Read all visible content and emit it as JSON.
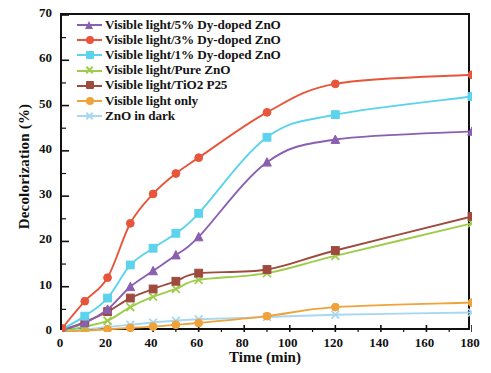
{
  "chart_data": {
    "type": "line",
    "title": "",
    "xlabel": "Time (min)",
    "ylabel": "Decolorization (%)",
    "xlim": [
      0,
      180
    ],
    "ylim": [
      0,
      70
    ],
    "xticks": [
      0,
      20,
      40,
      60,
      80,
      100,
      120,
      140,
      160,
      180
    ],
    "yticks": [
      0,
      10,
      20,
      30,
      40,
      50,
      60,
      70
    ],
    "grid": false,
    "legend_position": "top-left",
    "x": [
      0,
      10,
      20,
      30,
      40,
      50,
      60,
      90,
      120,
      180
    ],
    "series": [
      {
        "name": "Visible light/5% Dy-doped ZnO",
        "color": "#8B5FB0",
        "marker": "triangle",
        "values": [
          0.5,
          2.0,
          5.0,
          10.0,
          13.5,
          17.0,
          21.0,
          37.5,
          42.5,
          44.3
        ]
      },
      {
        "name": "Visible light/3% Dy-doped ZnO",
        "color": "#E8553A",
        "marker": "circle",
        "values": [
          0.8,
          6.8,
          12.0,
          24.0,
          30.5,
          35.0,
          38.5,
          48.5,
          54.8,
          56.8
        ]
      },
      {
        "name": "Visible light/1% Dy-doped ZnO",
        "color": "#5BD3EC",
        "marker": "square",
        "values": [
          0.6,
          3.5,
          7.5,
          14.8,
          18.5,
          21.8,
          26.2,
          43.0,
          48.0,
          52.0
        ]
      },
      {
        "name": "Visible light/Pure ZnO",
        "color": "#9FCC4A",
        "marker": "x",
        "values": [
          0.3,
          1.2,
          2.5,
          5.5,
          7.8,
          9.5,
          11.5,
          13.0,
          16.8,
          24.0
        ]
      },
      {
        "name": "Visible light/TiO2 P25",
        "color": "#9E4A3E",
        "marker": "square",
        "values": [
          0.4,
          2.2,
          4.5,
          7.5,
          9.5,
          11.2,
          13.0,
          13.8,
          18.0,
          25.5
        ]
      },
      {
        "name": "Visible light only",
        "color": "#F0A33A",
        "marker": "circle",
        "values": [
          0.1,
          0.3,
          0.6,
          0.9,
          1.2,
          1.6,
          2.0,
          3.5,
          5.5,
          6.5
        ]
      },
      {
        "name": "ZnO in dark",
        "color": "#A8D8F0",
        "marker": "x",
        "values": [
          0.2,
          0.6,
          1.1,
          1.6,
          2.1,
          2.5,
          2.8,
          3.3,
          3.8,
          4.3
        ]
      }
    ]
  }
}
